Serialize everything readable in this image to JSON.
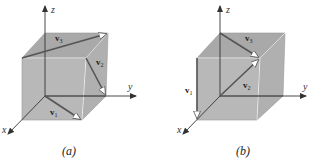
{
  "figures": [
    {
      "id": "a",
      "caption": "(a)",
      "axes": {
        "x": "x",
        "y": "y",
        "z": "z"
      },
      "vectors": [
        {
          "name": "v",
          "sub": "1",
          "from": "origin",
          "to": "front-bottom-right corner (diagonal of bottom face)"
        },
        {
          "name": "v",
          "sub": "2",
          "from": "front-top-right",
          "to": "back-bottom-right (diagonal of right face)"
        },
        {
          "name": "v",
          "sub": "3",
          "from": "front-top-left",
          "to": "back-top-right (diagonal of top face)"
        }
      ],
      "labels": {
        "v1": "v",
        "v1_sub": "1",
        "v2": "v",
        "v2_sub": "2",
        "v3": "v",
        "v3_sub": "3"
      }
    },
    {
      "id": "b",
      "caption": "(b)",
      "axes": {
        "x": "x",
        "y": "y",
        "z": "z"
      },
      "vectors": [
        {
          "name": "v",
          "sub": "1",
          "from": "front-top-left",
          "to": "front-bottom-left (vertical edge)"
        },
        {
          "name": "v",
          "sub": "2",
          "from": "origin",
          "to": "front-top-right (main diagonal)"
        },
        {
          "name": "v",
          "sub": "3",
          "from": "back-top-left",
          "to": "front-top-right (diagonal of top face)"
        }
      ],
      "labels": {
        "v1": "v",
        "v1_sub": "1",
        "v2": "v",
        "v2_sub": "2",
        "v3": "v",
        "v3_sub": "3"
      }
    }
  ],
  "colors": {
    "cube_fill": "#b4b4b4",
    "cube_top": "#a8a8a8",
    "edge_light": "#e6e6e6",
    "vector": "#555555",
    "axis": "#333333"
  }
}
